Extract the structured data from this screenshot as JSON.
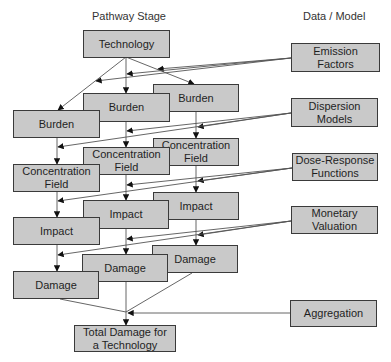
{
  "headers": {
    "pathway_stage": "Pathway Stage",
    "data_model": "Data / Model"
  },
  "pathway": {
    "technology": "Technology",
    "burden": [
      "Burden",
      "Burden",
      "Burden"
    ],
    "concentration": [
      "Concentration\nField",
      "Concentration\nField",
      "Concentration\nField"
    ],
    "impact": [
      "Impact",
      "Impact",
      "Impact"
    ],
    "damage": [
      "Damage",
      "Damage",
      "Damage"
    ],
    "total": "Total Damage for\na Technology"
  },
  "models": {
    "emission": "Emission\nFactors",
    "dispersion": "Dispersion\nModels",
    "dose_response": "Dose-Response\nFunctions",
    "monetary": "Monetary\nValuation",
    "aggregation": "Aggregation"
  },
  "colors": {
    "box_fill": "#c9c9c9",
    "box_border": "#3a3a3a",
    "line": "#555555"
  }
}
